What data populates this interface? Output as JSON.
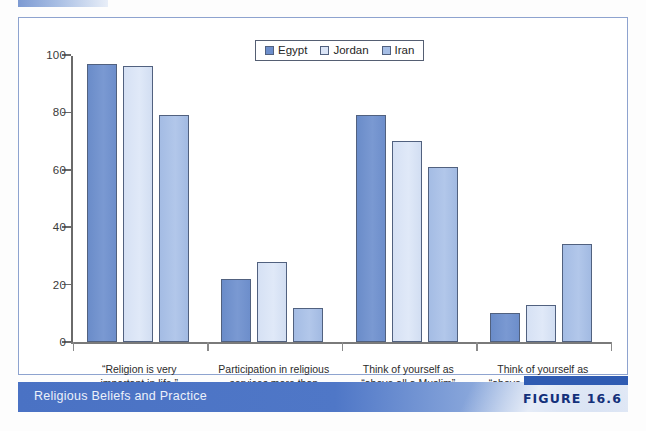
{
  "figure": {
    "caption": "Religious Beliefs and Practice",
    "number_label": "FIGURE 16.6"
  },
  "legend": {
    "position": "top-center",
    "entries": [
      {
        "label": "Egypt",
        "color": "#6d8ecb",
        "icon": "legend-swatch"
      },
      {
        "label": "Jordan",
        "color": "#dae4f6",
        "icon": "legend-swatch"
      },
      {
        "label": "Iran",
        "color": "#a6bee5",
        "icon": "legend-swatch"
      }
    ]
  },
  "axis": {
    "y_ticks": [
      "0",
      "20",
      "40",
      "60",
      "80",
      "100"
    ],
    "y_tick_values": [
      0,
      20,
      40,
      60,
      80,
      100
    ]
  },
  "categories": [
    {
      "line1": "“Religion is very",
      "line2": "important in life.”",
      "line3": ""
    },
    {
      "line1": "Participation in religious",
      "line2": "services more than",
      "line3": "once a week"
    },
    {
      "line1": "Think of yourself as",
      "line2": "“above all a Muslim”",
      "line3": ""
    },
    {
      "line1": "Think of yourself as",
      "line2": "“above all a nationalist”",
      "line3": ""
    }
  ],
  "chart_data": {
    "type": "bar",
    "title": "Religious Beliefs and Practice",
    "xlabel": "",
    "ylabel": "",
    "ylim": [
      0,
      100
    ],
    "grid": false,
    "legend_position": "top-center",
    "categories": [
      "“Religion is very important in life.”",
      "Participation in religious services more than once a week",
      "Think of yourself as “above all a Muslim”",
      "Think of yourself as “above all a nationalist”"
    ],
    "series": [
      {
        "name": "Egypt",
        "color": "#6d8ecb",
        "values": [
          97,
          22,
          79,
          10
        ]
      },
      {
        "name": "Jordan",
        "color": "#dae4f6",
        "values": [
          96,
          28,
          70,
          13
        ]
      },
      {
        "name": "Iran",
        "color": "#a6bee5",
        "values": [
          79,
          12,
          61,
          34
        ]
      }
    ]
  },
  "colors": {
    "series_egypt": "#6d8ecb",
    "series_jordan": "#dae4f6",
    "series_iran": "#a6bee5",
    "banner": "#4f77c7",
    "panel_border": "#8ea3cf"
  }
}
